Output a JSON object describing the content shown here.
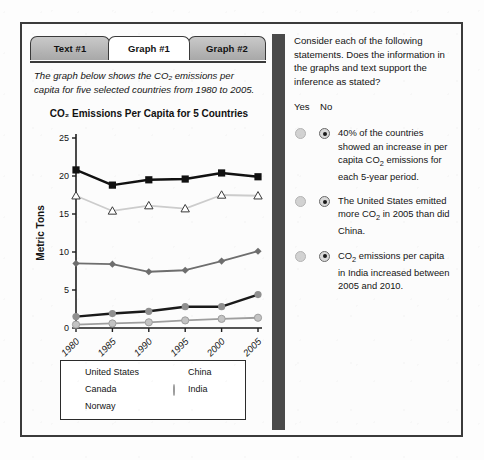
{
  "tabs": [
    {
      "label": "Text #1",
      "active": false
    },
    {
      "label": "Graph #1",
      "active": true
    },
    {
      "label": "Graph #2",
      "active": false
    }
  ],
  "intro": "The graph below shows the CO₂ emissions per capita for five selected countries from 1980 to 2005.",
  "legend": [
    {
      "name": "United States",
      "marker": "filled-square",
      "color": "#111111"
    },
    {
      "name": "Canada",
      "marker": "open-triangle",
      "color": "#c8c8c8"
    },
    {
      "name": "Norway",
      "marker": "filled-diamond",
      "color": "#6e6e6e"
    },
    {
      "name": "China",
      "marker": "filled-circle-dark",
      "color": "#8f8f8f"
    },
    {
      "name": "India",
      "marker": "filled-circle-light",
      "color": "#c3c3c3"
    }
  ],
  "right": {
    "prompt": "Consider each of the following statements. Does the information in the graphs and text support the inference as stated?",
    "yes_label": "Yes",
    "no_label": "No",
    "statements": [
      {
        "text_html": "40% of the countries showed an increase in per capita CO<sub>2</sub> emissions for each 5-year period.",
        "selected": "no"
      },
      {
        "text_html": "The United States emitted more CO<sub>2</sub> in 2005 than did China.",
        "selected": "no"
      },
      {
        "text_html": "CO<sub>2</sub> emissions per capita in India increased between 2005 and 2010.",
        "selected": "no"
      }
    ]
  },
  "chart_data": {
    "type": "line",
    "title": "CO₂ Emissions Per Capita for 5 Countries",
    "xlabel": "",
    "ylabel": "Metric Tons",
    "x": [
      "1980",
      "1985",
      "1990",
      "1995",
      "2000",
      "2005"
    ],
    "xtick_rotation": 45,
    "ylim": [
      0,
      25
    ],
    "yticks": [
      0,
      5,
      10,
      15,
      20,
      25
    ],
    "grid": false,
    "legend_position": "below-plot",
    "series": [
      {
        "name": "United States",
        "marker": "filled-square",
        "color": "#111111",
        "line_color": "#111111",
        "values": [
          20.8,
          18.8,
          19.5,
          19.6,
          20.4,
          19.9
        ]
      },
      {
        "name": "Canada",
        "marker": "open-triangle",
        "color": "#ffffff",
        "line_color": "#cccccc",
        "values": [
          17.4,
          15.4,
          16.1,
          15.7,
          17.5,
          17.4
        ]
      },
      {
        "name": "Norway",
        "marker": "filled-diamond",
        "color": "#6e6e6e",
        "line_color": "#6e6e6e",
        "values": [
          8.5,
          8.4,
          7.4,
          7.6,
          8.8,
          10.1
        ]
      },
      {
        "name": "China",
        "marker": "filled-circle-dark",
        "color": "#8f8f8f",
        "line_color": "#1a1a1a",
        "values": [
          1.5,
          1.9,
          2.2,
          2.8,
          2.8,
          4.4
        ]
      },
      {
        "name": "India",
        "marker": "filled-circle-light",
        "color": "#c3c3c3",
        "line_color": "#9e9e9e",
        "values": [
          0.45,
          0.6,
          0.75,
          1.0,
          1.2,
          1.35
        ]
      }
    ]
  }
}
